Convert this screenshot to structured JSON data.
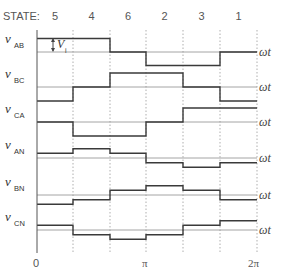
{
  "header": {
    "state_label": "STATE:",
    "states": [
      "5",
      "4",
      "6",
      "2",
      "3",
      "1"
    ]
  },
  "axis": {
    "x_start_label": "0",
    "x_mid_label": "π",
    "x_end_label": "2π",
    "omega_t_label": "ωt"
  },
  "annotation": {
    "vi_label": "V",
    "vi_subscript": "i"
  },
  "waveforms": [
    {
      "name": "v",
      "sub": "AB",
      "levels": [
        1,
        1,
        0,
        -1,
        -1,
        0
      ]
    },
    {
      "name": "v",
      "sub": "BC",
      "levels": [
        -1,
        0,
        1,
        1,
        0,
        -1
      ]
    },
    {
      "name": "v",
      "sub": "CA",
      "levels": [
        0,
        -1,
        -1,
        0,
        1,
        1
      ]
    },
    {
      "name": "v",
      "sub": "AN",
      "levels": [
        0.333,
        0.667,
        0.333,
        -0.333,
        -0.667,
        -0.333
      ]
    },
    {
      "name": "v",
      "sub": "BN",
      "levels": [
        -0.667,
        -0.333,
        0.333,
        0.667,
        0.333,
        -0.333
      ]
    },
    {
      "name": "v",
      "sub": "CN",
      "levels": [
        0.333,
        -0.333,
        -0.667,
        -0.333,
        0.333,
        0.667
      ]
    }
  ],
  "colors": {
    "waveform": "#3a3a3a",
    "baseline": "#9a9a9a",
    "divider": "#9a9a9a"
  }
}
